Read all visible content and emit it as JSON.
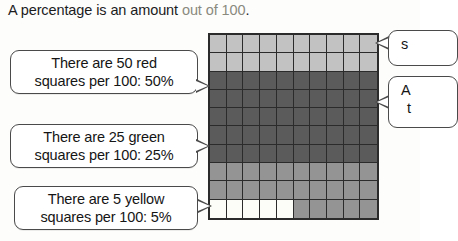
{
  "headline": {
    "lead": "A percentage is an amount ",
    "emphasis": "out of 100",
    "period": "."
  },
  "callouts": {
    "red": {
      "line1": "There are 50 red",
      "line2": "squares per 100: 50%"
    },
    "green": {
      "line1": "There are 25 green",
      "line2": "squares per 100: 25%"
    },
    "yellow": {
      "line1": "There are 5 yellow",
      "line2": "squares per 100: 5%"
    },
    "right_top": {
      "text": "s"
    },
    "right_bottom": {
      "line1": "A",
      "line2": "t"
    }
  },
  "chart_data": {
    "type": "heatmap",
    "rows": 10,
    "columns": 10,
    "total_cells": 100,
    "legend": [
      {
        "name": "red",
        "count": 50,
        "percent": "50%",
        "color": "#5b5b5b"
      },
      {
        "name": "green",
        "count": 25,
        "percent": "25%",
        "color": "#c2c2c2"
      },
      {
        "name": "blue",
        "count": 20,
        "percent": "20%",
        "color": "#949494"
      },
      {
        "name": "yellow",
        "count": 5,
        "percent": "5%",
        "color": "#fcfcf8"
      }
    ],
    "grid": [
      [
        "green",
        "green",
        "green",
        "green",
        "green",
        "green",
        "green",
        "green",
        "green",
        "green"
      ],
      [
        "green",
        "green",
        "green",
        "green",
        "green",
        "green",
        "green",
        "green",
        "green",
        "green"
      ],
      [
        "red",
        "red",
        "red",
        "red",
        "red",
        "red",
        "red",
        "red",
        "red",
        "red"
      ],
      [
        "red",
        "red",
        "red",
        "red",
        "red",
        "red",
        "red",
        "red",
        "red",
        "red"
      ],
      [
        "red",
        "red",
        "red",
        "red",
        "red",
        "red",
        "red",
        "red",
        "red",
        "red"
      ],
      [
        "red",
        "red",
        "red",
        "red",
        "red",
        "red",
        "red",
        "red",
        "red",
        "red"
      ],
      [
        "red",
        "red",
        "red",
        "red",
        "red",
        "red",
        "red",
        "red",
        "red",
        "red"
      ],
      [
        "blue",
        "blue",
        "blue",
        "blue",
        "blue",
        "blue",
        "blue",
        "blue",
        "blue",
        "blue"
      ],
      [
        "blue",
        "blue",
        "blue",
        "blue",
        "blue",
        "blue",
        "blue",
        "blue",
        "blue",
        "blue"
      ],
      [
        "yellow",
        "yellow",
        "yellow",
        "yellow",
        "yellow",
        "blue",
        "blue",
        "blue",
        "blue",
        "blue"
      ]
    ],
    "colors": {
      "green": "#c2c2c2",
      "red": "#5b5b5b",
      "blue": "#949494",
      "yellow": "#fcfcf8",
      "gridline": "#2b2b2b"
    }
  }
}
